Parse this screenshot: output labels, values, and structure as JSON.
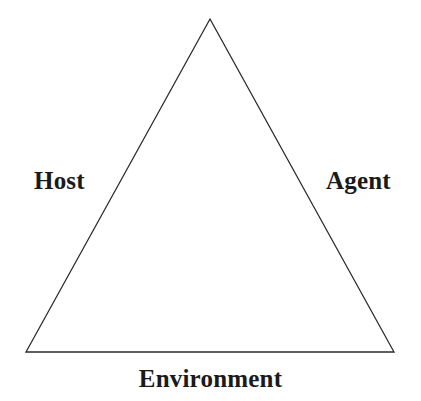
{
  "diagram": {
    "type": "triangle-relationship-diagram",
    "background_color": "#ffffff",
    "stroke_color": "#2b2b2b",
    "stroke_width": 1.3,
    "text_color": "#1a1a1a",
    "shape": {
      "name": "triangle",
      "vertices": [
        {
          "name": "apex",
          "x": 210,
          "y": 19
        },
        {
          "name": "bottom-left",
          "x": 26,
          "y": 352
        },
        {
          "name": "bottom-right",
          "x": 394,
          "y": 352
        }
      ]
    },
    "labels": {
      "left": "Host",
      "right": "Agent",
      "bottom": "Environment"
    }
  }
}
